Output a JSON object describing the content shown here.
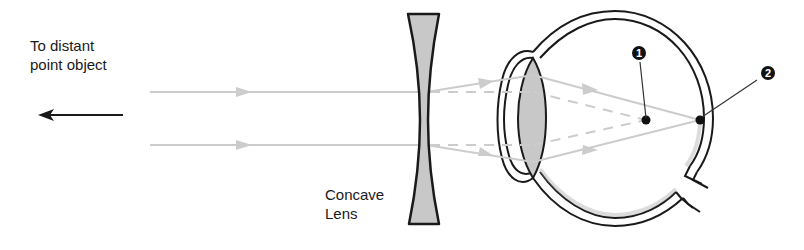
{
  "diagram": {
    "labels": {
      "object_line1": "To distant",
      "object_line2": "point object",
      "lens_line1": "Concave",
      "lens_line2": "Lens"
    },
    "callouts": [
      {
        "number": "1",
        "description": "focal point without lens (in front of retina)"
      },
      {
        "number": "2",
        "description": "focal point on retina with lens"
      }
    ],
    "colors": {
      "ray": "#cccccc",
      "outline": "#1a1a1a",
      "lens_fill": "#c8c8c8",
      "background": "#ffffff"
    }
  }
}
